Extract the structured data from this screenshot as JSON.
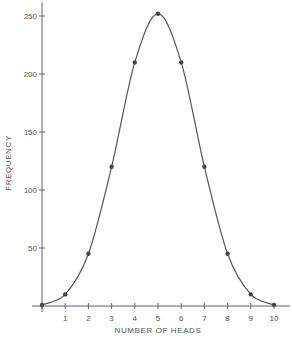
{
  "chart_data": {
    "type": "line",
    "title": "",
    "xlabel": "NUMBER OF HEADS",
    "ylabel": "FREQUENCY",
    "x": [
      0,
      1,
      2,
      3,
      4,
      5,
      6,
      7,
      8,
      9,
      10
    ],
    "series": [
      {
        "name": "Frequency",
        "values": [
          1,
          10,
          45,
          120,
          210,
          252,
          210,
          120,
          45,
          10,
          1
        ],
        "markers": true,
        "smooth": true
      }
    ],
    "xticks": [
      0,
      1,
      2,
      3,
      4,
      5,
      6,
      7,
      8,
      9,
      10
    ],
    "xtick_labels": [
      "",
      "1",
      "2",
      "3",
      "4",
      "5",
      "6",
      "7",
      "8",
      "9",
      "10"
    ],
    "yticks": [
      50,
      100,
      150,
      200,
      250
    ],
    "ytick_labels": [
      "50",
      "100",
      "150",
      "200",
      "250"
    ],
    "xlim": [
      0,
      10
    ],
    "ylim": [
      0,
      260
    ],
    "grid": false,
    "legend": null,
    "colors": {
      "line": "#555555",
      "marker": "#444444",
      "axis": "#666666",
      "text": "#555555",
      "background": "#ffffff"
    }
  }
}
